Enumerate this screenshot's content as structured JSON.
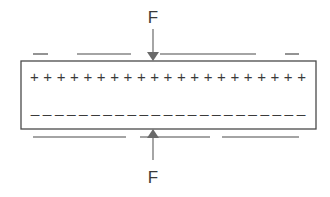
{
  "diagram": {
    "title": "",
    "force_top": {
      "label": "F",
      "direction": "down"
    },
    "force_bottom": {
      "label": "F",
      "direction": "up"
    },
    "plate": {
      "top_charges": "+",
      "top_charge_count": 21,
      "bottom_charges": "-",
      "bottom_charge_count": 21
    },
    "colors": {
      "stroke": "#4a4a4a",
      "text": "#3a3a3a",
      "background": "#ffffff"
    },
    "plus_row": "+++++++++++++++++++++",
    "minus_row": "-----------------------"
  }
}
